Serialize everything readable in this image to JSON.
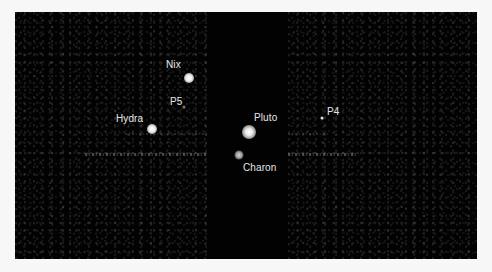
{
  "image": {
    "description": "Telescope image of Pluto and its moons",
    "background_color": "#020202",
    "frame_color": "#f7f7f7"
  },
  "bodies": [
    {
      "name": "Pluto",
      "label": "Pluto",
      "x": 234,
      "y": 120,
      "size": 14,
      "label_x": 239,
      "label_y": 100
    },
    {
      "name": "Charon",
      "label": "Charon",
      "x": 224,
      "y": 143,
      "size": 8,
      "label_x": 228,
      "label_y": 150
    },
    {
      "name": "Nix",
      "label": "Nix",
      "x": 174,
      "y": 66,
      "size": 10,
      "label_x": 151,
      "label_y": 47
    },
    {
      "name": "Hydra",
      "label": "Hydra",
      "x": 137,
      "y": 117,
      "size": 10,
      "label_x": 101,
      "label_y": 101
    },
    {
      "name": "P5",
      "label": "P5",
      "x": 169,
      "y": 95,
      "size": 3,
      "label_x": 155,
      "label_y": 84
    },
    {
      "name": "P4",
      "label": "P4",
      "x": 307,
      "y": 106,
      "size": 3,
      "label_x": 312,
      "label_y": 94
    }
  ]
}
